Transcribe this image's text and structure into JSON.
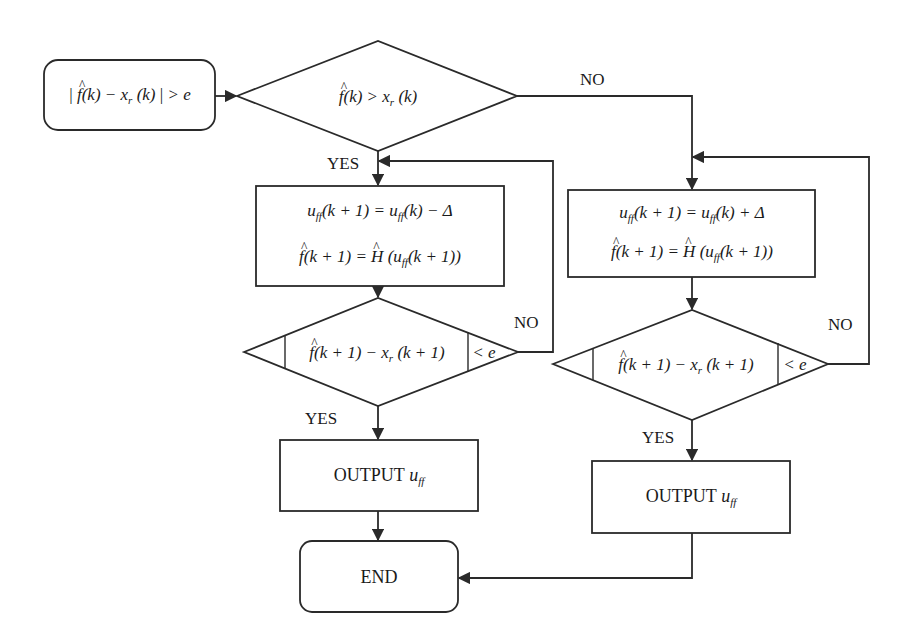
{
  "diagram": {
    "type": "flowchart",
    "nodes": {
      "start": {
        "shape": "rounded-rect",
        "text": "| f̂(k) − x_r(k) | > e",
        "parts": {
          "f": "f",
          "k": "(k) − x",
          "r": "r",
          "k2": " (k)",
          "rhs": "> e"
        }
      },
      "decision_main": {
        "shape": "diamond",
        "text": "f̂(k) > x_r(k)",
        "parts": {
          "f": "f",
          "mid": "(k) > x",
          "r": "r",
          "tail": " (k)"
        }
      },
      "process_decrease": {
        "shape": "rect",
        "line1": "u_ff(k + 1) = u_ff(k) − Δ",
        "line2": "f̂(k + 1) = Ĥ(u_ff(k + 1))",
        "parts": {
          "u": "u",
          "ff": "ff",
          "l1a": "(k + 1) = ",
          "l1b": "(k) − Δ",
          "f": "f",
          "l2a": "(k + 1) = ",
          "H": "H",
          "l2b": " (",
          "l2c": "(k + 1))"
        }
      },
      "process_increase": {
        "shape": "rect",
        "line1": "u_ff(k + 1) = u_ff(k) + Δ",
        "line2": "f̂(k + 1) = Ĥ(u_ff(k + 1))",
        "parts": {
          "u": "u",
          "ff": "ff",
          "l1a": "(k + 1) = ",
          "l1b": "(k) + Δ",
          "f": "f",
          "l2a": "(k + 1) = ",
          "H": "H",
          "l2b": " (",
          "l2c": "(k + 1))"
        }
      },
      "decision_left": {
        "shape": "diamond",
        "text": "| f̂(k + 1) − x_r(k + 1) | < e",
        "parts": {
          "f": "f",
          "mid": "(k + 1) − x",
          "r": "r",
          "tail": " (k + 1)",
          "rhs": "< e"
        }
      },
      "decision_right": {
        "shape": "diamond",
        "text": "| f̂(k + 1) − x_r(k + 1) | < e",
        "parts": {
          "f": "f",
          "mid": "(k + 1) − x",
          "r": "r",
          "tail": " (k + 1)",
          "rhs": "< e"
        }
      },
      "output_left": {
        "shape": "rect",
        "label": "OUTPUT",
        "var": "u",
        "sub": "ff"
      },
      "output_right": {
        "shape": "rect",
        "label": "OUTPUT",
        "var": "u",
        "sub": "ff"
      },
      "end": {
        "shape": "rounded-rect",
        "label": "END"
      }
    },
    "edges": [
      {
        "from": "start",
        "to": "decision_main",
        "label": ""
      },
      {
        "from": "decision_main",
        "to": "process_decrease",
        "label": "YES"
      },
      {
        "from": "decision_main",
        "to": "process_increase",
        "label": "NO"
      },
      {
        "from": "process_decrease",
        "to": "decision_left",
        "label": ""
      },
      {
        "from": "decision_left",
        "to": "process_decrease",
        "label": "NO"
      },
      {
        "from": "decision_left",
        "to": "output_left",
        "label": "YES"
      },
      {
        "from": "process_increase",
        "to": "decision_right",
        "label": ""
      },
      {
        "from": "decision_right",
        "to": "process_increase",
        "label": "NO"
      },
      {
        "from": "decision_right",
        "to": "output_right",
        "label": "YES"
      },
      {
        "from": "output_left",
        "to": "end",
        "label": ""
      },
      {
        "from": "output_right",
        "to": "end",
        "label": ""
      }
    ],
    "edge_labels": {
      "yes_main": "YES",
      "no_main": "NO",
      "no_left": "NO",
      "yes_left": "YES",
      "no_right": "NO",
      "yes_right": "YES"
    },
    "colors": {
      "stroke": "#2a2a2a",
      "fill": "#ffffff",
      "text": "#1a1a1a"
    }
  }
}
